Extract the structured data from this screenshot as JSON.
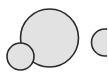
{
  "canvas": {
    "width": 107,
    "height": 77,
    "background": "#ffffff"
  },
  "style": {
    "fill": "#e2e2e2",
    "stroke": "#2a2a2a",
    "stroke_width": 1.6
  },
  "shapes": [
    {
      "name": "large-circle",
      "cx": 49.5,
      "cy": 38,
      "r": 29
    },
    {
      "name": "small-circle",
      "cx": 20.5,
      "cy": 56.5,
      "r": 13.5
    },
    {
      "name": "partial-circle-right",
      "cx": 105,
      "cy": 42.5,
      "r": 13.5
    }
  ]
}
